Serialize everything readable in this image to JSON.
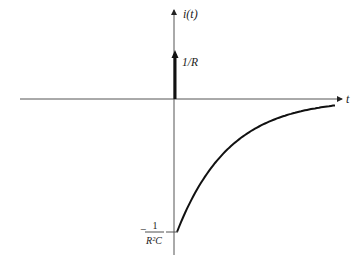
{
  "diagram": {
    "type": "impulse-response-plot",
    "y_axis_label": "i(t)",
    "x_axis_label": "t",
    "impulse_label": "1/R",
    "min_value_label": {
      "sign": "−",
      "numerator": "1",
      "denominator": "R²C"
    },
    "curve": "exponential decay from -1/(R²C) toward 0",
    "colors": {
      "ink": "#222222",
      "axis": "#555555",
      "background": "#ffffff"
    }
  }
}
